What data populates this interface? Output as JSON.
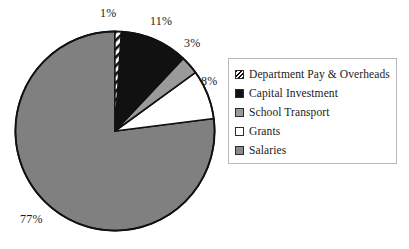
{
  "chart_data": {
    "type": "pie",
    "title": "",
    "subtitle": "",
    "xlabel": "",
    "ylabel": "",
    "grid": false,
    "legend_position": "right",
    "units": "percent",
    "start_angle_deg": 0,
    "direction": "clockwise",
    "categories": [
      "Department Pay & Overheads",
      "Capital Investment",
      "School Transport",
      "Grants",
      "Salaries"
    ],
    "values": [
      1,
      11,
      3,
      8,
      77
    ],
    "labels": [
      "1%",
      "11%",
      "3%",
      "8%",
      "77%"
    ],
    "slices": [
      {
        "name": "Department Pay & Overheads",
        "value": 1,
        "label": "1%",
        "fill": "diagonal-hatch",
        "color": "#ffffff",
        "stroke": "#111111",
        "start_deg": 0,
        "end_deg": 3.6
      },
      {
        "name": "Capital Investment",
        "value": 11,
        "label": "11%",
        "fill": "solid",
        "color": "#111111",
        "stroke": "#111111",
        "start_deg": 3.6,
        "end_deg": 43.2
      },
      {
        "name": "School Transport",
        "value": 3,
        "label": "3%",
        "fill": "solid",
        "color": "#9a9a9a",
        "stroke": "#111111",
        "start_deg": 43.2,
        "end_deg": 54.0
      },
      {
        "name": "Grants",
        "value": 8,
        "label": "8%",
        "fill": "solid",
        "color": "#ffffff",
        "stroke": "#111111",
        "start_deg": 54.0,
        "end_deg": 82.8
      },
      {
        "name": "Salaries",
        "value": 77,
        "label": "77%",
        "fill": "solid",
        "color": "#808080",
        "stroke": "#111111",
        "start_deg": 82.8,
        "end_deg": 360.0
      }
    ]
  },
  "pie": {
    "labels": {
      "one": "1%",
      "eleven": "11%",
      "three": "3%",
      "eight": "8%",
      "seventyseven": "77%"
    }
  },
  "legend": {
    "items": [
      {
        "label": "Department Pay & Overheads",
        "swatch": "hatch"
      },
      {
        "label": "Capital Investment",
        "swatch": "black"
      },
      {
        "label": "School Transport",
        "swatch": "gray"
      },
      {
        "label": "Grants",
        "swatch": "white"
      },
      {
        "label": "Salaries",
        "swatch": "gray2"
      }
    ]
  },
  "colors": {
    "black": "#111111",
    "mid_gray": "#9a9a9a",
    "pie_gray": "#808080",
    "white": "#ffffff",
    "legend_border": "#b9b9b9",
    "background": "#ffffff"
  }
}
